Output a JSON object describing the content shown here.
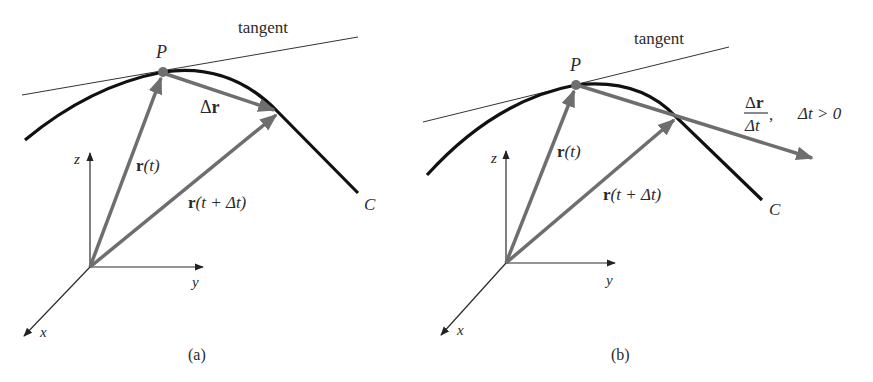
{
  "figure": {
    "panels": [
      {
        "id": "a",
        "caption": "(a)",
        "tangent_label": "tangent",
        "point_label": "P",
        "curve_label": "C",
        "vectors": {
          "r_t": {
            "bold": "r",
            "rest": "(t)"
          },
          "r_t_dt": {
            "bold": "r",
            "rest": "(t + Δt)"
          },
          "delta_r": {
            "delta": "Δ",
            "bold": "r"
          }
        },
        "axes": {
          "x": "x",
          "y": "y",
          "z": "z"
        }
      },
      {
        "id": "b",
        "caption": "(b)",
        "tangent_label": "tangent",
        "point_label": "P",
        "curve_label": "C",
        "vectors": {
          "r_t": {
            "bold": "r",
            "rest": "(t)"
          },
          "r_t_dt": {
            "bold": "r",
            "rest": "(t + Δt)"
          },
          "quotient": {
            "num_delta": "Δ",
            "num_bold": "r",
            "den": "Δt",
            "comma": ",",
            "condition": "Δt > 0"
          }
        },
        "axes": {
          "x": "x",
          "y": "y",
          "z": "z"
        }
      }
    ],
    "colors": {
      "curve": "#111111",
      "vector": "#6e6e6e",
      "axis": "#2a2a2a",
      "tangent": "#333333",
      "point": "#707070"
    }
  }
}
